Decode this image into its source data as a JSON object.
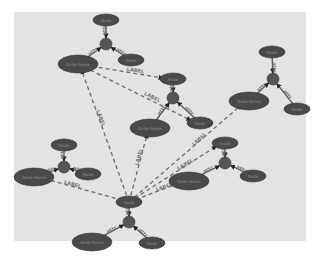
{
  "diagram": {
    "type": "graph",
    "background": "#e3e3e3",
    "node_color": "#4a4a4a",
    "edge_color": "#555555",
    "dashed_edge_color": "#6b6b6b",
    "clusters": [
      {
        "id": "c1",
        "hub": {
          "x": 106,
          "y": 44,
          "r": 6
        },
        "nodes": [
          {
            "id": "c1-top",
            "x": 106,
            "y": 20,
            "rx": 13,
            "ry": 6,
            "label": "Node"
          },
          {
            "id": "c1-right",
            "x": 131,
            "y": 60,
            "rx": 13,
            "ry": 6,
            "label": "Node"
          },
          {
            "id": "c1-main",
            "x": 78,
            "y": 64,
            "rx": 20,
            "ry": 9,
            "label": "Node Name"
          }
        ],
        "edge_labels": [
          "attr",
          "attr",
          "attr"
        ]
      },
      {
        "id": "c2",
        "hub": {
          "x": 173,
          "y": 98,
          "r": 6
        },
        "nodes": [
          {
            "id": "c2-top",
            "x": 173,
            "y": 79,
            "rx": 13,
            "ry": 6,
            "label": "Node"
          },
          {
            "id": "c2-right",
            "x": 200,
            "y": 123,
            "rx": 13,
            "ry": 6,
            "label": "Node"
          },
          {
            "id": "c2-main",
            "x": 150,
            "y": 128,
            "rx": 20,
            "ry": 9,
            "label": "Node Name"
          }
        ],
        "edge_labels": [
          "attr",
          "attr",
          "attr"
        ]
      },
      {
        "id": "c3",
        "hub": {
          "x": 273,
          "y": 79,
          "r": 6
        },
        "nodes": [
          {
            "id": "c3-top",
            "x": 272,
            "y": 52,
            "rx": 13,
            "ry": 6,
            "label": "Node"
          },
          {
            "id": "c3-right",
            "x": 297,
            "y": 109,
            "rx": 13,
            "ry": 6,
            "label": "Node"
          },
          {
            "id": "c3-main",
            "x": 249,
            "y": 101,
            "rx": 20,
            "ry": 9,
            "label": "Node Name"
          }
        ],
        "edge_labels": [
          "attr",
          "attr",
          "attr"
        ]
      },
      {
        "id": "c4",
        "hub": {
          "x": 64,
          "y": 167,
          "r": 6
        },
        "nodes": [
          {
            "id": "c4-top",
            "x": 64,
            "y": 145,
            "rx": 13,
            "ry": 6,
            "label": "Node"
          },
          {
            "id": "c4-right",
            "x": 88,
            "y": 174,
            "rx": 13,
            "ry": 6,
            "label": "Node"
          },
          {
            "id": "c4-main",
            "x": 34,
            "y": 177,
            "rx": 20,
            "ry": 9,
            "label": "Node Name"
          }
        ],
        "edge_labels": [
          "attr",
          "attr",
          "attr"
        ]
      },
      {
        "id": "c5",
        "hub": {
          "x": 225,
          "y": 163,
          "r": 6
        },
        "nodes": [
          {
            "id": "c5-top",
            "x": 225,
            "y": 143,
            "rx": 13,
            "ry": 6,
            "label": "Node"
          },
          {
            "id": "c5-right",
            "x": 253,
            "y": 176,
            "rx": 13,
            "ry": 6,
            "label": "Node"
          },
          {
            "id": "c5-main",
            "x": 189,
            "y": 181,
            "rx": 20,
            "ry": 9,
            "label": "Node Name"
          }
        ],
        "edge_labels": [
          "attr",
          "attr",
          "attr"
        ]
      },
      {
        "id": "c6",
        "hub": {
          "x": 129,
          "y": 222,
          "r": 6
        },
        "nodes": [
          {
            "id": "c6-top",
            "x": 129,
            "y": 202,
            "rx": 13,
            "ry": 6,
            "label": "Node"
          },
          {
            "id": "c6-right",
            "x": 152,
            "y": 243,
            "rx": 13,
            "ry": 6,
            "label": "Node"
          },
          {
            "id": "c6-main",
            "x": 92,
            "y": 242,
            "rx": 20,
            "ry": 9,
            "label": "Node Name"
          }
        ],
        "edge_labels": [
          "attr",
          "attr",
          "attr"
        ]
      }
    ],
    "dashed_edges": [
      {
        "from": [
          129,
          202
        ],
        "to": [
          78,
          64
        ],
        "label": "LABEL"
      },
      {
        "from": [
          129,
          202
        ],
        "to": [
          150,
          128
        ],
        "label": "LABEL"
      },
      {
        "from": [
          129,
          202
        ],
        "to": [
          34,
          177
        ],
        "label": "LABEL"
      },
      {
        "from": [
          129,
          202
        ],
        "to": [
          189,
          181
        ],
        "label": "LABEL"
      },
      {
        "from": [
          129,
          202
        ],
        "to": [
          249,
          101
        ],
        "label": "LABEL"
      },
      {
        "from": [
          129,
          202
        ],
        "to": [
          225,
          143
        ],
        "label": "LABEL"
      },
      {
        "from": [
          78,
          64
        ],
        "to": [
          173,
          79
        ],
        "label": "LABEL"
      },
      {
        "from": [
          78,
          64
        ],
        "to": [
          200,
          123
        ],
        "label": "LABEL"
      }
    ]
  }
}
